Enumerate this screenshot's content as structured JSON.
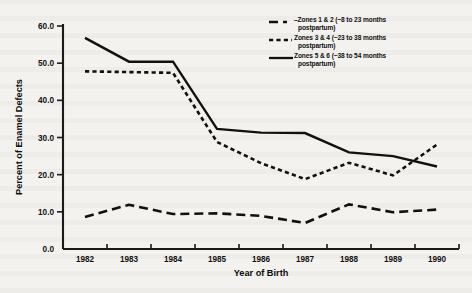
{
  "chart_data": {
    "type": "line",
    "title": "",
    "xlabel": "Year of Birth",
    "ylabel": "Percent of Enamel Defects",
    "x": [
      1982,
      1983,
      1984,
      1985,
      1986,
      1987,
      1988,
      1989,
      1990
    ],
    "xtick_labels": [
      "1982",
      "1983",
      "1984",
      "1985",
      "1986",
      "1987",
      "1988",
      "1989",
      "1990"
    ],
    "ytick_labels": [
      "0.0",
      "10.0",
      "20.0",
      "30.0",
      "40.0",
      "50.0",
      "60.0"
    ],
    "ytick_values": [
      0.0,
      10.0,
      20.0,
      30.0,
      40.0,
      50.0,
      60.0
    ],
    "ylim": [
      0.0,
      60.0
    ],
    "grid": false,
    "legend_position": "top-right",
    "series": [
      {
        "name": "Zones 1 & 2 (~8 to 23 months postpartum)",
        "label_line1": "–Zones 1 & 2 (~8 to 23 months",
        "label_line2": "postpartum)",
        "style": "long-dash",
        "values": [
          8.6,
          11.9,
          9.4,
          9.6,
          8.9,
          7.0,
          12.0,
          9.9,
          10.6
        ]
      },
      {
        "name": "Zones 3 & 4 (~23 to 38 months postpartum)",
        "label_line1": "Zones 3 & 4 (~23 to 38 months",
        "label_line2": "postpartum)",
        "style": "short-dash",
        "values": [
          47.8,
          47.6,
          47.4,
          28.8,
          23.1,
          18.8,
          23.2,
          19.8,
          28.1
        ]
      },
      {
        "name": "Zones 5 & 6 (~38 to 54 months postpartum)",
        "label_line1": "Zones 5 & 6 (~38 to 54 months",
        "label_line2": "postpartum)",
        "style": "solid",
        "values": [
          56.8,
          50.4,
          50.4,
          32.3,
          31.3,
          31.2,
          26.0,
          25.0,
          22.2
        ]
      }
    ]
  }
}
